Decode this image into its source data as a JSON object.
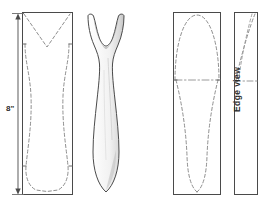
{
  "drawing": {
    "title": "Spoon / fork carving blank layout",
    "background_color": "#ffffff",
    "solid_line_color": "#4a4a4a",
    "dashed_line_color": "#8c8c8c",
    "shading_color": "#b5b5b5",
    "annotations": {
      "height_dimension": "8\"",
      "edge_view": "Edge view"
    },
    "views": [
      {
        "id": "view-1",
        "name": "front-blank-layout",
        "type": "rectangle-with-hidden-outline",
        "rect": {
          "x": 22,
          "y": 12,
          "width": 51,
          "height": 183
        },
        "hidden_outline": "forked-tine-v-notch-with-waisted-handle"
      },
      {
        "id": "view-2",
        "name": "carved-fork-profile",
        "type": "shaded-solid-profile",
        "bbox": {
          "x": 83,
          "y": 12,
          "width": 44,
          "height": 185
        },
        "hidden_outline": "none"
      },
      {
        "id": "view-3",
        "name": "bowl-side-layout",
        "type": "rectangle-with-hidden-outline",
        "rect": {
          "x": 173,
          "y": 12,
          "width": 48,
          "height": 183
        },
        "hidden_outline": "oval-bowl-with-tapered-handle-and-centerline"
      },
      {
        "id": "view-4",
        "name": "edge-view-layout",
        "type": "narrow-rectangle-with-hidden-outline",
        "rect": {
          "x": 234,
          "y": 12,
          "width": 24,
          "height": 183
        },
        "hidden_outline": "thin-edge-taper-profile"
      }
    ],
    "dimension_line": {
      "name": "height-dimension-line",
      "value": "8\"",
      "x": 18,
      "y_top": 16,
      "y_bottom": 192,
      "arrowheads": "both-ends"
    }
  }
}
